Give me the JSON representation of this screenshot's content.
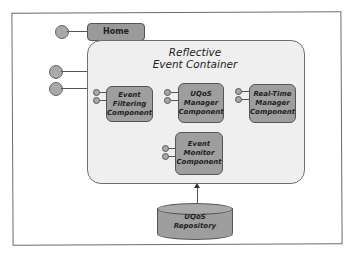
{
  "diagram": {
    "home": {
      "label": "Home"
    },
    "container": {
      "title_line1": "Reflective",
      "title_line2": "Event Container"
    },
    "components": [
      {
        "id": "event-filtering",
        "lines": [
          "Event",
          "Filtering",
          "Component"
        ]
      },
      {
        "id": "uqos-manager",
        "lines": [
          "UQoS",
          "Manager",
          "Component"
        ]
      },
      {
        "id": "real-time-manager",
        "lines": [
          "Real-Time",
          "Manager",
          "Component"
        ]
      },
      {
        "id": "event-monitor",
        "lines": [
          "Event",
          "Monitor",
          "Component"
        ]
      }
    ],
    "repository": {
      "lines": [
        "UQoS",
        "Repository"
      ]
    },
    "colors": {
      "component_fill": "#9e9e9e",
      "container_fill": "#efefef",
      "border": "#555555"
    }
  }
}
